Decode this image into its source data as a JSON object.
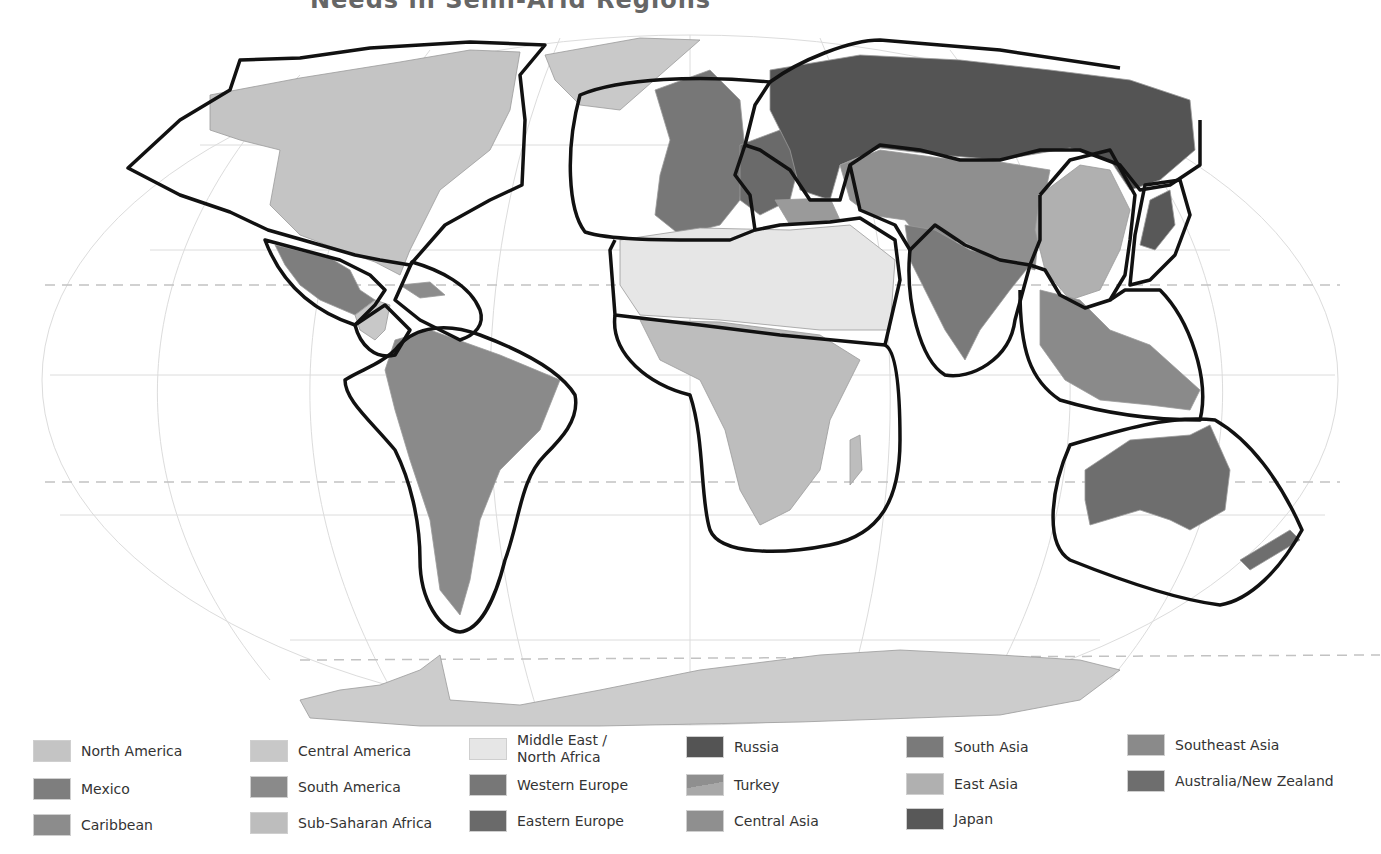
{
  "title": "Needs in Semi-Arid Regions",
  "map": {
    "projection": "Robinson",
    "background_color": "#ffffff",
    "graticule_color": "#d6d6d6",
    "tropic_dash_color": "#bdbdbd",
    "outline_color": "#111111",
    "antarctica_color": "#cccccc"
  },
  "legend": {
    "items": [
      {
        "label": "North America",
        "color": "#c4c4c4"
      },
      {
        "label": "Mexico",
        "color": "#7e7e7e"
      },
      {
        "label": "Caribbean",
        "color": "#8c8c8c"
      },
      {
        "label": "Central America",
        "color": "#c8c8c8"
      },
      {
        "label": "South America",
        "color": "#8a8a8a"
      },
      {
        "label": "Sub-Saharan Africa",
        "color": "#bdbdbd"
      },
      {
        "label": "Middle East /\nNorth Africa",
        "color": "#e6e6e6"
      },
      {
        "label": "Western Europe",
        "color": "#777777"
      },
      {
        "label": "Eastern Europe",
        "color": "#6a6a6a"
      },
      {
        "label": "Russia",
        "color": "#545454"
      },
      {
        "label": "Turkey",
        "color": "#9a9a9a"
      },
      {
        "label": "Central Asia",
        "color": "#8f8f8f"
      },
      {
        "label": "South Asia",
        "color": "#7a7a7a"
      },
      {
        "label": "East Asia",
        "color": "#b0b0b0"
      },
      {
        "label": "Japan",
        "color": "#585858"
      },
      {
        "label": "Southeast Asia",
        "color": "#8a8a8a"
      },
      {
        "label": "Australia/New Zealand",
        "color": "#6e6e6e"
      }
    ]
  }
}
